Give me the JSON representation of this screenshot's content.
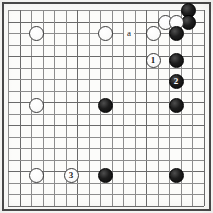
{
  "figure": {
    "kind": "go-board-diagram",
    "board": {
      "lines": 18,
      "origin_x": 8,
      "origin_y": 10,
      "spacing": 11.5,
      "background_color": "#fcfcfa",
      "line_color": "#8d8d8d",
      "heavy_line_color": "#6a6a6a",
      "border_color": "#4a4a4a",
      "heavy_cols": [
        1,
        6,
        12,
        17
      ],
      "heavy_rows": [
        1,
        4,
        8,
        10,
        14,
        17
      ]
    },
    "stone_colors": {
      "black": "#101010",
      "white": "#ffffff",
      "black_outline": "#000000",
      "white_outline": "#3b3b3b"
    },
    "stone_diameter": 15,
    "stones": [
      {
        "id": "b-top-corner-1",
        "color": "black",
        "label": "",
        "x": 188,
        "y": 10
      },
      {
        "id": "b-top-corner-2",
        "color": "black",
        "label": "",
        "x": 188,
        "y": 22
      },
      {
        "id": "w-top-1",
        "color": "white",
        "label": "",
        "x": 165,
        "y": 22
      },
      {
        "id": "w-top-2",
        "color": "white",
        "label": "",
        "x": 176,
        "y": 22
      },
      {
        "id": "b-top-3",
        "color": "black",
        "label": "",
        "x": 176,
        "y": 33
      },
      {
        "id": "w-upper-left-star",
        "color": "white",
        "label": "",
        "x": 36,
        "y": 33
      },
      {
        "id": "w-upper-middle",
        "color": "white",
        "label": "",
        "x": 105,
        "y": 33
      },
      {
        "id": "w-upper-right",
        "color": "white",
        "label": "",
        "x": 153,
        "y": 33
      },
      {
        "id": "w-move-1",
        "color": "white",
        "label": "1",
        "x": 153,
        "y": 60
      },
      {
        "id": "b-right-4",
        "color": "black",
        "label": "",
        "x": 176,
        "y": 60
      },
      {
        "id": "b-move-2",
        "color": "black",
        "label": "2",
        "x": 176,
        "y": 81
      },
      {
        "id": "w-left-star",
        "color": "white",
        "label": "",
        "x": 36,
        "y": 105
      },
      {
        "id": "b-center",
        "color": "black",
        "label": "",
        "x": 105,
        "y": 105
      },
      {
        "id": "b-right-center",
        "color": "black",
        "label": "",
        "x": 176,
        "y": 105
      },
      {
        "id": "w-bottom-left",
        "color": "white",
        "label": "",
        "x": 36,
        "y": 175
      },
      {
        "id": "w-move-3",
        "color": "white",
        "label": "3",
        "x": 71,
        "y": 175
      },
      {
        "id": "b-bottom-mid",
        "color": "black",
        "label": "",
        "x": 105,
        "y": 175
      },
      {
        "id": "b-bottom-right",
        "color": "black",
        "label": "",
        "x": 176,
        "y": 175
      }
    ],
    "point_markers": [
      {
        "id": "marker-a",
        "label": "a",
        "x": 129,
        "y": 33
      }
    ],
    "move_sequence": [
      {
        "number": "1",
        "color": "white"
      },
      {
        "number": "2",
        "color": "black"
      },
      {
        "number": "3",
        "color": "white"
      }
    ]
  }
}
